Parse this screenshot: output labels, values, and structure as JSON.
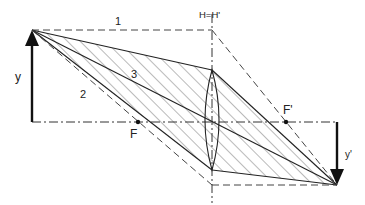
{
  "diagram": {
    "labels": {
      "principal_planes": "H=H'",
      "object_height": "y",
      "image_height": "y'",
      "front_focus": "F",
      "back_focus": "F'",
      "ray1": "1",
      "ray2": "2",
      "ray3": "3"
    },
    "colors": {
      "line": "#222222",
      "dashed": "#444444",
      "hatch": "#555555",
      "background": "#ffffff"
    }
  }
}
